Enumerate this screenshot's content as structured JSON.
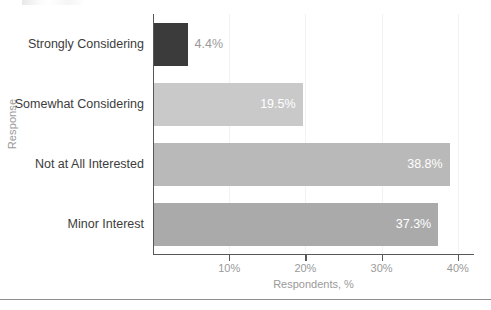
{
  "chart_data": {
    "type": "bar",
    "orientation": "horizontal",
    "title": "",
    "xlabel": "Respondents, %",
    "ylabel": "Response",
    "categories": [
      "Strongly Considering",
      "Somewhat Considering",
      "Not at All Interested",
      "Minor Interest"
    ],
    "values": [
      4.4,
      19.5,
      38.8,
      37.3
    ],
    "value_labels": [
      "4.4%",
      "19.5%",
      "38.8%",
      "37.3%"
    ],
    "bar_colors": [
      "#3b3b3b",
      "#c9c9c9",
      "#b9b9b9",
      "#aaaaaa"
    ],
    "label_inside": [
      false,
      true,
      true,
      true
    ],
    "xlim": [
      0,
      42.4
    ],
    "xticks": [
      10,
      20,
      30,
      40
    ],
    "xtick_labels": [
      "10%",
      "20%",
      "30%",
      "40%"
    ],
    "grid": true,
    "grid_axis": "x",
    "legend": "none"
  },
  "axes": {
    "y_title": "Response",
    "x_title": "Respondents, %"
  },
  "colors": {
    "axis": "#58585a",
    "grid": "#f2f2f2",
    "tick_text": "#9a9a9a",
    "category_text": "#3c3c3c",
    "value_text_inside": "#ffffff",
    "value_text_outside": "#9a9a9a",
    "rule": "#8e8e8e",
    "background": "#ffffff"
  }
}
